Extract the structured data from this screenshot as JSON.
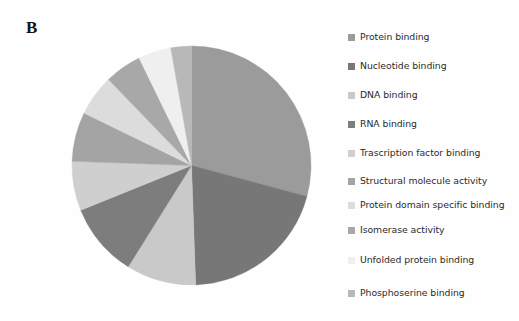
{
  "panel": {
    "label": "B"
  },
  "chart_data": {
    "type": "pie",
    "title": "",
    "legend_position": "right",
    "start_angle_deg": 0,
    "direction": "clockwise",
    "categories": [
      "Protein binding",
      "Nucleotide binding",
      "DNA binding",
      "RNA binding",
      "Trascription factor binding",
      "Structural molecule activity",
      "Protein domain specific binding",
      "Isomerase activity",
      "Unfolded protein binding",
      "Phosphoserine binding"
    ],
    "values": [
      29.2,
      20.3,
      9.4,
      10.0,
      6.7,
      6.7,
      5.6,
      5.0,
      4.4,
      2.7
    ],
    "colors": [
      "#9b9b9b",
      "#777777",
      "#c9c9c9",
      "#7d7d7d",
      "#cfcfcf",
      "#a4a4a4",
      "#dcdcdc",
      "#a8a8a8",
      "#efefef",
      "#b8b8b8"
    ],
    "slice_angles_deg": [
      {
        "start": 0,
        "end": 105.0
      },
      {
        "start": 105.0,
        "end": 178.0
      },
      {
        "start": 178.0,
        "end": 212.0
      },
      {
        "start": 212.0,
        "end": 248.0
      },
      {
        "start": 248.0,
        "end": 272.0
      },
      {
        "start": 272.0,
        "end": 296.0
      },
      {
        "start": 296.0,
        "end": 316.0
      },
      {
        "start": 316.0,
        "end": 334.0
      },
      {
        "start": 334.0,
        "end": 350.0
      },
      {
        "start": 350.0,
        "end": 360.0
      }
    ]
  },
  "legend": {
    "items": [
      {
        "label": "Protein binding",
        "color": "#9b9b9b"
      },
      {
        "label": "Nucleotide binding",
        "color": "#777777"
      },
      {
        "label": "DNA binding",
        "color": "#c9c9c9"
      },
      {
        "label": "RNA binding",
        "color": "#7d7d7d"
      },
      {
        "label": "Trascription factor binding",
        "color": "#cfcfcf"
      },
      {
        "label": "Structural molecule activity",
        "color": "#a4a4a4"
      },
      {
        "label": "Protein domain specific binding",
        "color": "#dcdcdc"
      },
      {
        "label": "Isomerase activity",
        "color": "#a8a8a8"
      },
      {
        "label": "Unfolded protein binding",
        "color": "#efefef"
      },
      {
        "label": "Phosphoserine binding",
        "color": "#b8b8b8"
      }
    ]
  }
}
